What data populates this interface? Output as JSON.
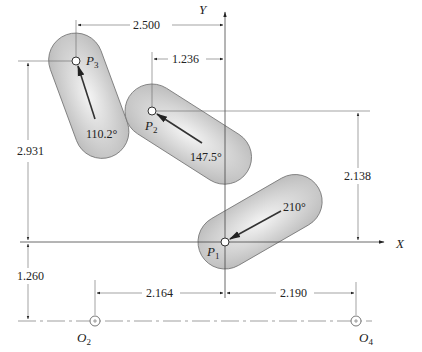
{
  "diagram": {
    "type": "mechanism-precision-positions",
    "axes": {
      "x_label": "X",
      "y_label": "Y"
    },
    "precision_points": [
      {
        "label": "P",
        "subscript": "1",
        "angle": "210°"
      },
      {
        "label": "P",
        "subscript": "2",
        "angle": "147.5°"
      },
      {
        "label": "P",
        "subscript": "3",
        "angle": "110.2°"
      }
    ],
    "ground_pivots": [
      {
        "label": "O",
        "subscript": "2"
      },
      {
        "label": "O",
        "subscript": "4"
      }
    ],
    "dimensions": {
      "p3_x": "2.500",
      "p2_x": "1.236",
      "p2_y": "2.138",
      "p3_y": "2.931",
      "pivot_y": "1.260",
      "o2_x": "2.164",
      "o4_x": "2.190"
    },
    "colors": {
      "link_fill": "#c8c8c8",
      "link_highlight": "#f2f2f2",
      "line": "#444444"
    }
  }
}
